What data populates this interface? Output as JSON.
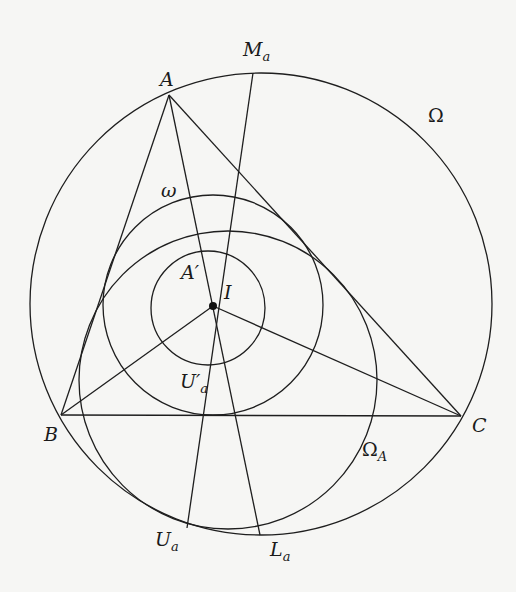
{
  "diagram": {
    "stroke_color": "#1e1e1e",
    "background": "#f6f6f4",
    "points": {
      "A": {
        "x": 169,
        "y": 95
      },
      "B": {
        "x": 61,
        "y": 415
      },
      "C": {
        "x": 461,
        "y": 416
      },
      "I": {
        "x": 213,
        "y": 306
      },
      "M_a": {
        "x": 253,
        "y": 73
      },
      "U_a": {
        "x": 187,
        "y": 528
      },
      "L_a": {
        "x": 260,
        "y": 535
      }
    },
    "circles": {
      "Omega": {
        "cx": 261,
        "cy": 304,
        "r": 231
      },
      "omega": {
        "cx": 213,
        "cy": 305,
        "r": 110
      },
      "Omega_A": {
        "cx": 228,
        "cy": 380,
        "r": 149
      },
      "inner": {
        "cx": 208,
        "cy": 308,
        "r": 57
      }
    },
    "labels": {
      "A": {
        "main": "A",
        "sub": ""
      },
      "B": {
        "main": "B",
        "sub": ""
      },
      "C": {
        "main": "C",
        "sub": ""
      },
      "I": {
        "main": "I",
        "sub": ""
      },
      "M_a": {
        "main": "M",
        "sub": "a"
      },
      "U_a": {
        "main": "U",
        "sub": "a"
      },
      "L_a": {
        "main": "L",
        "sub": "a"
      },
      "A_prime": {
        "main": "A′",
        "sub": ""
      },
      "U_a_prime": {
        "main": "U′",
        "sub": "a"
      },
      "Omega": {
        "main": "Ω",
        "sub": ""
      },
      "Omega_A": {
        "main": "Ω",
        "sub": "A"
      },
      "omega": {
        "main": "ω",
        "sub": ""
      }
    }
  }
}
